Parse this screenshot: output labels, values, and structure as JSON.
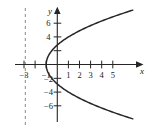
{
  "chart_data": {
    "type": "line",
    "title": "",
    "subtitle": "",
    "xlabel": "x",
    "ylabel": "y",
    "xlim": [
      -3.6,
      6.2
    ],
    "ylim": [
      -8.6,
      8.6
    ],
    "grid": false,
    "legend": null,
    "x_ticks": [
      {
        "value": -3,
        "label": "−3"
      },
      {
        "value": -2,
        "label": ""
      },
      {
        "value": -1,
        "label": "−1"
      },
      {
        "value": 1,
        "label": "1"
      },
      {
        "value": 2,
        "label": "2"
      },
      {
        "value": 3,
        "label": "3"
      },
      {
        "value": 4,
        "label": "4"
      },
      {
        "value": 5,
        "label": "5"
      }
    ],
    "y_ticks": [
      {
        "value": 6,
        "label": "6"
      },
      {
        "value": 4,
        "label": "4"
      },
      {
        "value": 2,
        "label": ""
      },
      {
        "value": -2,
        "label": "−2"
      },
      {
        "value": -4,
        "label": "−4"
      },
      {
        "value": -6,
        "label": "−6"
      }
    ],
    "series": [
      {
        "name": "parabola",
        "kind": "curve",
        "equation": "y^2 = 8(x + 1)",
        "vertex": [
          -1,
          0
        ],
        "opens": "right",
        "color": "#262626",
        "points": [
          [
            -1,
            0
          ],
          [
            -0.875,
            -1
          ],
          [
            -0.5,
            -2
          ],
          [
            0.125,
            -3
          ],
          [
            1,
            -4
          ],
          [
            2.125,
            -5
          ],
          [
            3.5,
            -6
          ],
          [
            5.125,
            -7.2
          ],
          [
            6.0,
            -7.8
          ],
          [
            -0.875,
            1
          ],
          [
            -0.5,
            2
          ],
          [
            0.125,
            3
          ],
          [
            1,
            4
          ],
          [
            2.125,
            5
          ],
          [
            3.5,
            6
          ],
          [
            5.125,
            7.2
          ],
          [
            6.0,
            7.8
          ]
        ]
      }
    ],
    "annotations": [
      {
        "kind": "vertical-dashed-line",
        "name": "directrix",
        "x": -3,
        "label": "",
        "color": "#808080",
        "dash": "3 3"
      }
    ],
    "axes": {
      "x_axis_label": "x",
      "y_axis_label": "y",
      "x_arrow": true,
      "y_arrow": true,
      "color": "#262626"
    }
  }
}
